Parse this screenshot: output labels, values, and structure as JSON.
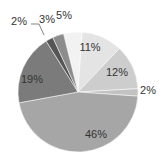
{
  "chart_data": {
    "type": "pie",
    "title": "",
    "start_angle_deg": -14,
    "direction": "clockwise",
    "slices": [
      {
        "label": "5%",
        "value": 5,
        "color": "#f2f2f2"
      },
      {
        "label": "11%",
        "value": 11,
        "color": "#e4e4e4"
      },
      {
        "label": "12%",
        "value": 12,
        "color": "#cdcdcd"
      },
      {
        "label": "2%",
        "value": 2,
        "color": "#c2c2c2"
      },
      {
        "label": "46%",
        "value": 46,
        "color": "#a6a6a6"
      },
      {
        "label": "19%",
        "value": 19,
        "color": "#7b7b7b"
      },
      {
        "label": "2%",
        "value": 2,
        "color": "#555555"
      },
      {
        "label": "3%",
        "value": 3,
        "color": "#8c8c8c"
      }
    ],
    "legend": "none"
  },
  "labels": [
    {
      "text": "5%",
      "x": 64,
      "y": 15
    },
    {
      "text": "11%",
      "x": 90,
      "y": 47
    },
    {
      "text": "12%",
      "x": 117,
      "y": 72
    },
    {
      "text": "2%",
      "x": 148,
      "y": 90
    },
    {
      "text": "46%",
      "x": 96,
      "y": 134
    },
    {
      "text": "19%",
      "x": 32,
      "y": 79
    },
    {
      "text": "2%",
      "x": 19,
      "y": 21
    },
    {
      "text": "3%",
      "x": 47,
      "y": 19
    }
  ]
}
